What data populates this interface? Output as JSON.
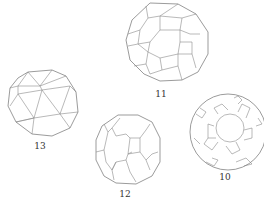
{
  "figure": {
    "type": "polyhedra-wireframes",
    "items": [
      {
        "id": "poly-13",
        "label": "13",
        "shape": "snub-cube-like",
        "cx": 42,
        "cy": 103,
        "r": 36,
        "label_x": 40,
        "label_y": 141
      },
      {
        "id": "poly-11",
        "label": "11",
        "shape": "truncated-icosidodecahedron-like",
        "cx": 166,
        "cy": 41,
        "r": 40,
        "label_x": 161,
        "label_y": 89
      },
      {
        "id": "poly-12",
        "label": "12",
        "shape": "truncated-cuboctahedron-like",
        "cx": 128,
        "cy": 152,
        "r": 34,
        "label_x": 125,
        "label_y": 189
      },
      {
        "id": "poly-10",
        "label": "10",
        "shape": "truncated-icosidodecahedron-like",
        "cx": 228,
        "cy": 132,
        "r": 38,
        "label_x": 225,
        "label_y": 172
      }
    ]
  },
  "colors": {
    "stroke": "#8a8a8a",
    "background": "#ffffff",
    "text": "#333333"
  }
}
